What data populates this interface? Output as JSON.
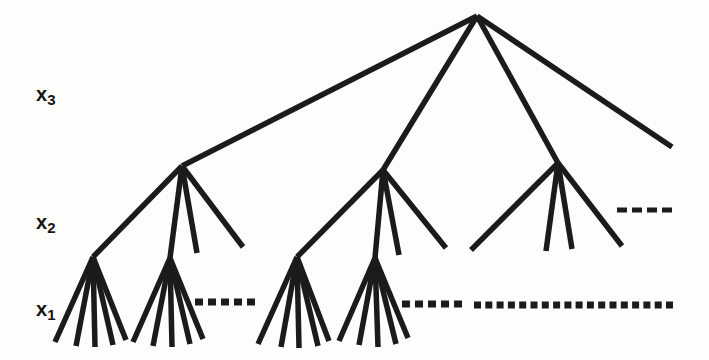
{
  "figure": {
    "type": "tree-diagram",
    "background": "#fdfdfc",
    "line_color": "#1b1b1b",
    "line_width": 5.5,
    "labels": [
      {
        "id": "x3",
        "base": "x",
        "sub": "3"
      },
      {
        "id": "x2",
        "base": "x",
        "sub": "2"
      },
      {
        "id": "x1",
        "base": "x",
        "sub": "1"
      }
    ],
    "nodes": {
      "root": [
        477,
        16
      ],
      "level2": [
        [
          182,
          166
        ],
        [
          383,
          170
        ],
        [
          558,
          163
        ]
      ],
      "level1": [
        [
          93,
          257
        ],
        [
          170,
          258
        ],
        [
          297,
          257
        ],
        [
          375,
          258
        ]
      ]
    },
    "edges": [
      [
        477,
        16,
        182,
        166
      ],
      [
        477,
        16,
        383,
        170
      ],
      [
        477,
        16,
        558,
        163
      ],
      [
        477,
        16,
        672,
        147
      ],
      [
        182,
        166,
        93,
        257
      ],
      [
        182,
        166,
        170,
        258
      ],
      [
        182,
        166,
        197,
        253
      ],
      [
        182,
        166,
        243,
        247
      ],
      [
        383,
        170,
        297,
        257
      ],
      [
        383,
        170,
        375,
        258
      ],
      [
        383,
        170,
        399,
        255
      ],
      [
        383,
        170,
        446,
        248
      ],
      [
        558,
        163,
        471,
        250
      ],
      [
        558,
        163,
        546,
        251
      ],
      [
        558,
        163,
        572,
        249
      ],
      [
        558,
        163,
        622,
        246
      ],
      [
        93,
        257,
        55,
        342
      ],
      [
        93,
        257,
        76,
        346
      ],
      [
        93,
        257,
        95,
        347
      ],
      [
        93,
        257,
        113,
        345
      ],
      [
        93,
        257,
        126,
        340
      ],
      [
        170,
        258,
        133,
        342
      ],
      [
        170,
        258,
        153,
        346
      ],
      [
        170,
        258,
        172,
        347
      ],
      [
        170,
        258,
        190,
        344
      ],
      [
        170,
        258,
        203,
        339
      ],
      [
        297,
        257,
        258,
        344
      ],
      [
        297,
        257,
        281,
        347
      ],
      [
        297,
        257,
        299,
        348
      ],
      [
        297,
        257,
        318,
        346
      ],
      [
        297,
        257,
        329,
        341
      ],
      [
        375,
        258,
        339,
        341
      ],
      [
        375,
        258,
        359,
        345
      ],
      [
        375,
        258,
        378,
        347
      ],
      [
        375,
        258,
        396,
        344
      ],
      [
        375,
        258,
        408,
        338
      ]
    ],
    "dotted_lines": [
      {
        "level": "x2",
        "y": 210,
        "x1": 617,
        "x2": 672,
        "count": 4,
        "dot_w": 10,
        "dot_h": 5
      },
      {
        "level": "x1",
        "y": 302,
        "x1": 195,
        "x2": 255,
        "count": 5,
        "dot_w": 8,
        "dot_h": 7
      },
      {
        "level": "x1",
        "y": 304,
        "x1": 402,
        "x2": 462,
        "count": 5,
        "dot_w": 8,
        "dot_h": 7
      },
      {
        "level": "x1",
        "y": 305,
        "x1": 474,
        "x2": 673,
        "count": 18,
        "dot_w": 7,
        "dot_h": 7
      }
    ]
  }
}
